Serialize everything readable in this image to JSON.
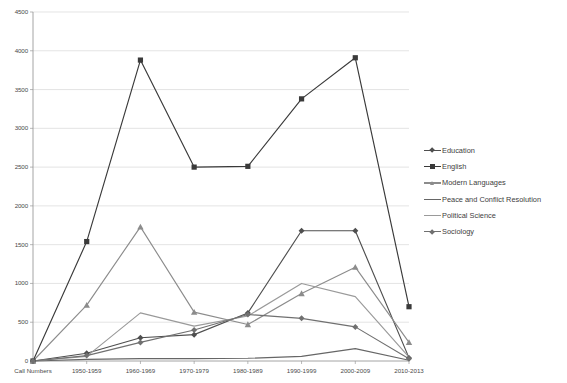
{
  "chart_data": {
    "type": "line",
    "title": "",
    "xlabel": "",
    "ylabel": "",
    "grid": true,
    "legend_position": "right",
    "ylim": [
      0,
      4500
    ],
    "ytick_step": 500,
    "yticks": [
      "0",
      "500",
      "1000",
      "1500",
      "2000",
      "2500",
      "3000",
      "3500",
      "4000",
      "4500"
    ],
    "categories": [
      "Call Numbers",
      "1950-1959",
      "1960-1969",
      "1970-1979",
      "1980-1989",
      "1990-1999",
      "2000-2009",
      "2010-2013"
    ],
    "series": [
      {
        "name": "Education",
        "values": [
          0,
          100,
          300,
          340,
          620,
          1680,
          1680,
          40
        ],
        "color": "#4f4f4f",
        "marker": "diamond"
      },
      {
        "name": "English",
        "values": [
          0,
          1540,
          3880,
          2500,
          2510,
          3380,
          3910,
          700
        ],
        "color": "#3a3a3a",
        "marker": "square"
      },
      {
        "name": "Modern Languages",
        "values": [
          0,
          720,
          1730,
          630,
          470,
          870,
          1210,
          240
        ],
        "color": "#8c8c8c",
        "marker": "triangle"
      },
      {
        "name": "Peace and Conflict Resolution",
        "values": [
          0,
          20,
          30,
          30,
          35,
          60,
          160,
          10
        ],
        "color": "#666666",
        "marker": "none"
      },
      {
        "name": "Political Science",
        "values": [
          0,
          60,
          620,
          450,
          580,
          1000,
          830,
          50
        ],
        "color": "#9a9a9a",
        "marker": "none"
      },
      {
        "name": "Sociology",
        "values": [
          0,
          70,
          240,
          400,
          600,
          550,
          440,
          30
        ],
        "color": "#707070",
        "marker": "diamond"
      }
    ]
  },
  "legend": {
    "items": [
      {
        "label": "Education"
      },
      {
        "label": "English"
      },
      {
        "label": "Modern Languages"
      },
      {
        "label": "Peace and Conflict Resolution"
      },
      {
        "label": "Political Science"
      },
      {
        "label": "Sociology"
      }
    ]
  }
}
